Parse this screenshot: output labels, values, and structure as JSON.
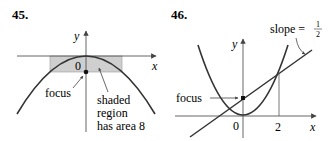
{
  "figures": [
    {
      "number": "45.",
      "axis_x_label": "x",
      "axis_y_label": "y",
      "origin_label": "0",
      "focus_label": "focus",
      "annotation_lines": [
        "shaded",
        "region",
        "has area 8"
      ],
      "colors": {
        "curve": "#333333",
        "shade": "#cfcfcf",
        "axis": "#555555"
      }
    },
    {
      "number": "46.",
      "axis_x_label": "x",
      "axis_y_label": "y",
      "origin_label": "0",
      "tick_label": "2",
      "focus_label": "focus",
      "slope_label": "slope =",
      "slope_num": "1",
      "slope_den": "2",
      "colors": {
        "curve": "#333333",
        "line": "#333333",
        "axis": "#555555"
      }
    }
  ]
}
